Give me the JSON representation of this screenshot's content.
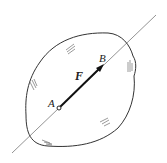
{
  "diagram": {
    "labels": {
      "point_a": "A",
      "point_b": "B",
      "force": "F"
    },
    "colors": {
      "stroke": "#333333",
      "line": "#777777",
      "hatch": "#555555"
    }
  }
}
